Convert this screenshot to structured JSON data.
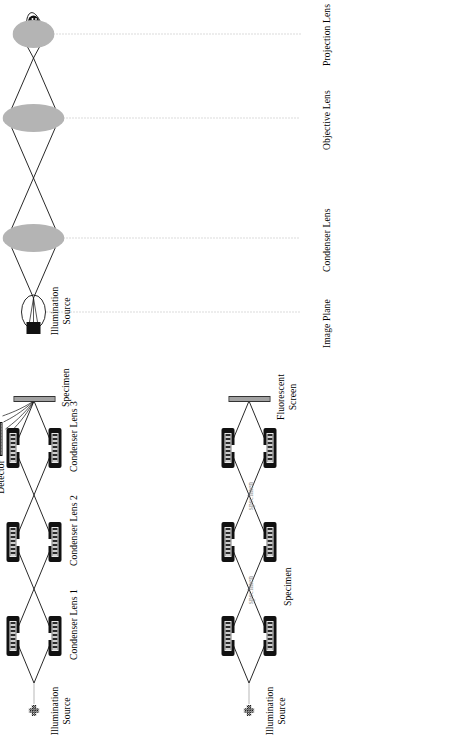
{
  "figure": {
    "type": "schematic-diagram",
    "orientation": "rotated-90-ccw"
  },
  "panel_light": {
    "name": "light-microscope-column",
    "source_label": "Illumination\nSource",
    "source_icon": "light-bulb-icon",
    "detector_icon": "eye-icon",
    "stage_labels": [
      {
        "id": "condenser-lens",
        "text": "Condenser Lens"
      },
      {
        "id": "objective-lens",
        "text": "Objective Lens"
      },
      {
        "id": "projection-lens",
        "text": "Projection Lens"
      },
      {
        "id": "image-plane",
        "text": "Image Plane"
      }
    ],
    "lens_icon": "glass-lens-icon"
  },
  "panel_tem": {
    "name": "tem-column",
    "source_label": "Illumination\nSource",
    "source_icon": "electron-gun-icon",
    "specimen_label": "Specimen",
    "specimen_markers": [
      "specimen",
      "specimen"
    ],
    "screen_label": "Fluorescent\nScreen",
    "screen_icon": "fluorescent-screen-icon",
    "lens_icon": "magnetic-lens-icon"
  },
  "panel_stem": {
    "name": "stem-column",
    "source_label": "Illumination\nSource",
    "source_icon": "electron-gun-icon",
    "lens_labels": [
      "Condenser Lens 1",
      "Condenser Lens 2",
      "Condenser Lens 3"
    ],
    "specimen_label": "Specimen",
    "specimen_icon": "specimen-bar-icon",
    "detector_label": "Signal\nDetector",
    "detector_icon": "signal-detector-icon",
    "lens_icon": "magnetic-lens-icon"
  },
  "colors": {
    "ink": "#111111",
    "faint_text": "#8d8d8d",
    "axis": "#9a9a9a",
    "lens_fill": "#a8a8a8",
    "background": "#ffffff"
  }
}
